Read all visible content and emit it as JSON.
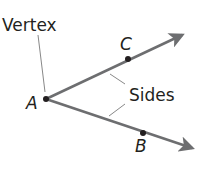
{
  "diagram": {
    "labels": {
      "vertex": "Vertex",
      "sides": "Sides",
      "point_a": "A",
      "point_b": "B",
      "point_c": "C"
    },
    "colors": {
      "ray": "#6d6e70",
      "text": "#231f20",
      "leader": "#888888",
      "point": "#231f20"
    }
  }
}
